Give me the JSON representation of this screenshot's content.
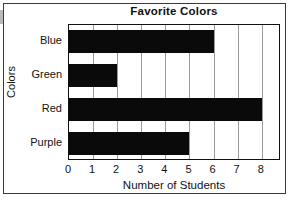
{
  "figure": {
    "title": "Favorite Colors",
    "border_color": "#3a3a3a",
    "bar_color": "#0a0a0a",
    "grid_color": "#9a9a9a"
  },
  "chart_data": {
    "type": "bar",
    "orientation": "horizontal",
    "title": "Favorite Colors",
    "xlabel": "Number of Students",
    "ylabel": "Colors",
    "categories": [
      "Blue",
      "Green",
      "Red",
      "Purple"
    ],
    "values": [
      6,
      2,
      8,
      5
    ],
    "xlim": [
      0,
      8.8
    ],
    "xticks": [
      0,
      1,
      2,
      3,
      4,
      5,
      6,
      7,
      8
    ],
    "xtick_labels": [
      "0",
      "1",
      "2",
      "3",
      "4",
      "5",
      "6",
      "7",
      "8"
    ],
    "grid": "vertical",
    "legend": null
  }
}
